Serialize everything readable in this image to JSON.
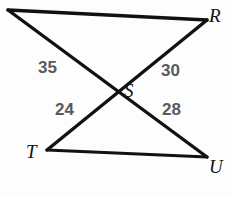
{
  "figure": {
    "type": "geometry-diagram",
    "background_color": "#fdfdfd",
    "line_color": "#111111",
    "vertex_label_color": "#111111",
    "measure_label_color": "#5a5a5a",
    "vertices": [
      {
        "name": "corner-top-left",
        "label": "",
        "x": 8,
        "y": 10
      },
      {
        "name": "vertex-r",
        "label": "R",
        "x": 207,
        "y": 20
      },
      {
        "name": "vertex-s",
        "label": "S",
        "x": 113,
        "y": 87
      },
      {
        "name": "vertex-t",
        "label": "T",
        "x": 47,
        "y": 150
      },
      {
        "name": "vertex-u",
        "label": "U",
        "x": 207,
        "y": 157
      }
    ],
    "segments": [
      {
        "name": "segment-top",
        "from": "corner-top-left",
        "to": "R",
        "x1": 8,
        "y1": 10,
        "x2": 207,
        "y2": 20
      },
      {
        "name": "segment-bottom",
        "from": "T",
        "to": "U",
        "x1": 47,
        "y1": 150,
        "x2": 207,
        "y2": 157
      },
      {
        "name": "segment-topleft-to-u",
        "from": "corner-top-left",
        "to": "U",
        "x1": 8,
        "y1": 10,
        "x2": 207,
        "y2": 157
      },
      {
        "name": "segment-r-to-t",
        "from": "R",
        "to": "T",
        "x1": 207,
        "y1": 20,
        "x2": 47,
        "y2": 150
      }
    ],
    "vertex_labels": [
      {
        "name": "vertex-label-r",
        "text": "R",
        "x": 209,
        "y": 6
      },
      {
        "name": "vertex-label-s",
        "text": "S",
        "x": 124,
        "y": 81
      },
      {
        "name": "vertex-label-t",
        "text": "T",
        "x": 26,
        "y": 142
      },
      {
        "name": "vertex-label-u",
        "text": "U",
        "x": 209,
        "y": 157
      }
    ],
    "measures": [
      {
        "name": "measure-upper-left",
        "text": "35",
        "x": 38,
        "y": 59,
        "segment": "segment-r-to-t"
      },
      {
        "name": "measure-upper-right",
        "text": "30",
        "x": 161,
        "y": 62,
        "segment": "segment-topleft-to-u"
      },
      {
        "name": "measure-lower-left",
        "text": "24",
        "x": 55,
        "y": 101,
        "segment": "segment-topleft-to-u"
      },
      {
        "name": "measure-lower-right",
        "text": "28",
        "x": 162,
        "y": 101,
        "segment": "segment-r-to-t"
      }
    ]
  }
}
